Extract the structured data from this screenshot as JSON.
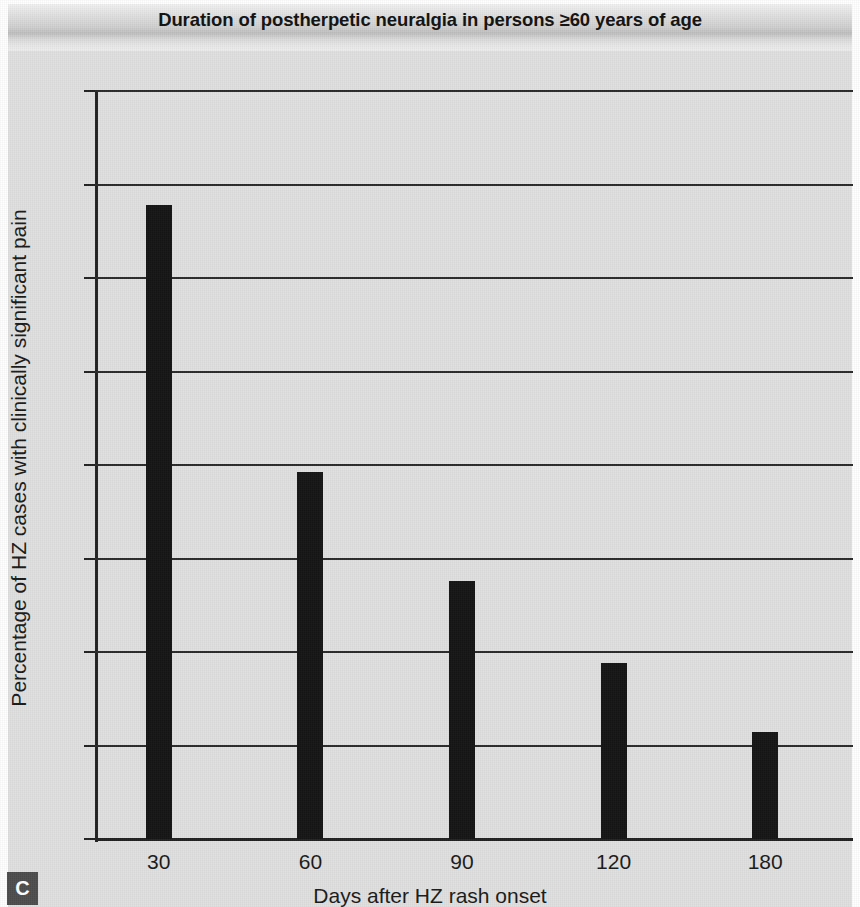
{
  "figure": {
    "panel_letter": "C",
    "title": "Duration of postherpetic neuralgia in persons ≥60 years of age"
  },
  "chart_data": {
    "type": "bar",
    "title": "Duration of postherpetic neuralgia in persons ≥60 years of age",
    "xlabel": "Days after HZ rash onset",
    "ylabel": "Percentage of HZ cases with clinically significant pain",
    "categories": [
      "30",
      "60",
      "90",
      "120",
      "180"
    ],
    "values": [
      33.9,
      19.6,
      13.8,
      9.4,
      5.7
    ],
    "ylim": [
      0,
      40
    ],
    "yticks": [
      0,
      5,
      10,
      15,
      20,
      25,
      30,
      35,
      40
    ],
    "ytick_labels": [
      "0",
      "5",
      "10",
      "15",
      "20",
      "25",
      "30",
      "35",
      "40"
    ],
    "grid": true,
    "grid_axis": "y",
    "legend": null,
    "bar_color": "#141414",
    "plot_background": "#e0e0e0"
  }
}
